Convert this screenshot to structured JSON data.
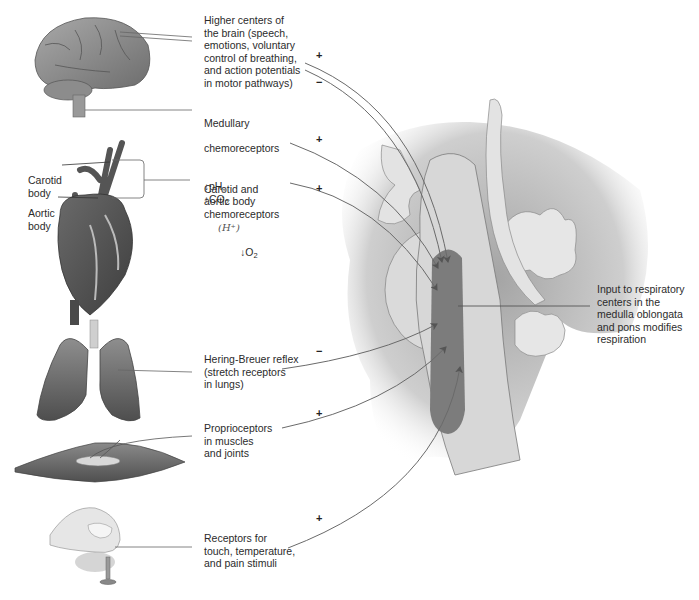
{
  "diagram": {
    "title": "",
    "colors": {
      "background": "#ffffff",
      "text": "#2b2b2b",
      "arrow": "#6a6a6a",
      "brainstem_light": "#d9d9d9",
      "respiratory_center": "#7c7c7c",
      "tissue_shadow": "#a8a8a8"
    },
    "inputs": [
      {
        "id": "higher-centers",
        "label": "Higher centers of\nthe brain (speech,\nemotions, voluntary\ncontrol of breathing,\nand action potentials\nin motor pathways)",
        "signs": [
          "+",
          "−"
        ],
        "illustration": "brain"
      },
      {
        "id": "medullary-chemoreceptors",
        "label_line1": "Medullary",
        "label_line2": "chemoreceptors",
        "stimulus": {
          "ph_arrow": "↓",
          "ph_text": "pH,",
          "co2_arrow": "↑",
          "co2_text": "CO",
          "co2_sub": "2",
          "handwritten": "(H⁺)"
        },
        "signs": [
          "+"
        ]
      },
      {
        "id": "carotid-aortic",
        "label": "Carotid and\naortic body\nchemoreceptors",
        "stimulus": {
          "o2_arrow": "↓",
          "o2_text": "O",
          "o2_sub": "2"
        },
        "signs": [
          "+"
        ],
        "illustration": "heart"
      },
      {
        "id": "hering-breuer",
        "label": "Hering-Breuer reflex\n(stretch receptors\nin lungs)",
        "signs": [
          "−"
        ],
        "illustration": "lungs"
      },
      {
        "id": "proprioceptors",
        "label": "Proprioceptors\nin muscles\nand joints",
        "signs": [
          "+"
        ],
        "illustration": "muscle"
      },
      {
        "id": "touch-receptors",
        "label": "Receptors for\ntouch, temperature,\nand pain stimuli",
        "signs": [
          "+"
        ],
        "illustration": "finger-on-pin"
      }
    ],
    "anatomy_labels": {
      "carotid_body": "Carotid\nbody",
      "aortic_body": "Aortic\nbody"
    },
    "output": {
      "label": "Input to respiratory\ncenters in the\nmedulla oblongata\nand pons modifies\nrespiration"
    }
  }
}
